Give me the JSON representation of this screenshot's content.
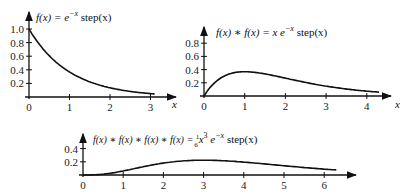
{
  "chart_data": [
    {
      "type": "line",
      "title": "f(x) = e^{-x} step(x)",
      "title_parts": {
        "main": "f(x) = e",
        "sup": "−x",
        "tail": " step(x)"
      },
      "xlabel": "x",
      "ylabel": "",
      "xlim": [
        0,
        3.1
      ],
      "ylim": [
        0,
        1.0
      ],
      "xticks": [
        "0",
        "1",
        "2",
        "3"
      ],
      "yticks": [
        "0.2",
        "0.4",
        "0.6",
        "0.8",
        "1.0"
      ],
      "grid": false,
      "series": [
        {
          "name": "e^{-x}",
          "x": [
            0,
            0.5,
            1,
            1.5,
            2,
            2.5,
            3,
            3.1
          ],
          "values": [
            1.0,
            0.61,
            0.37,
            0.22,
            0.14,
            0.08,
            0.05,
            0.045
          ]
        }
      ]
    },
    {
      "type": "line",
      "title": "f(x) * f(x) = x e^{-x} step(x)",
      "title_parts": {
        "main": "f(x) ∗ f(x) = x e",
        "sup": "−x",
        "tail": " step(x)"
      },
      "xlabel": "x",
      "ylabel": "",
      "xlim": [
        0,
        4.3
      ],
      "ylim": [
        0,
        0.8
      ],
      "xticks": [
        "0",
        "1",
        "2",
        "3",
        "4"
      ],
      "yticks": [
        "0.2",
        "0.4",
        "0.6",
        "0.8"
      ],
      "grid": false,
      "series": [
        {
          "name": "x e^{-x}",
          "x": [
            0,
            0.5,
            1,
            1.5,
            2,
            2.5,
            3,
            3.5,
            4,
            4.3
          ],
          "values": [
            0,
            0.3,
            0.37,
            0.33,
            0.27,
            0.21,
            0.15,
            0.11,
            0.07,
            0.06
          ]
        }
      ]
    },
    {
      "type": "line",
      "title": "f(x) * f(x) * f(x) * f(x) = (1/6) x^3 e^{-x} step(x)",
      "title_parts": {
        "main": "f(x) ∗ f(x) ∗ f(x) ∗ f(x)  =  ",
        "frac_num": "1",
        "frac_den": "6",
        "mid": "x",
        "sup1": "3",
        "mid2": " e",
        "sup2": "−x",
        "tail": " step(x)"
      },
      "xlabel": "",
      "ylabel": "",
      "xlim": [
        0,
        6.3
      ],
      "ylim": [
        0,
        0.4
      ],
      "xticks": [
        "0",
        "1",
        "2",
        "3",
        "4",
        "5",
        "6"
      ],
      "yticks": [
        "0.2",
        "0.4"
      ],
      "grid": false,
      "series": [
        {
          "name": "(1/6) x^3 e^{-x}",
          "x": [
            0,
            0.5,
            1,
            1.5,
            2,
            2.5,
            3,
            3.5,
            4,
            4.5,
            5,
            5.5,
            6,
            6.3
          ],
          "values": [
            0,
            0.013,
            0.061,
            0.126,
            0.18,
            0.214,
            0.224,
            0.216,
            0.195,
            0.169,
            0.14,
            0.113,
            0.089,
            0.077
          ]
        }
      ]
    }
  ]
}
